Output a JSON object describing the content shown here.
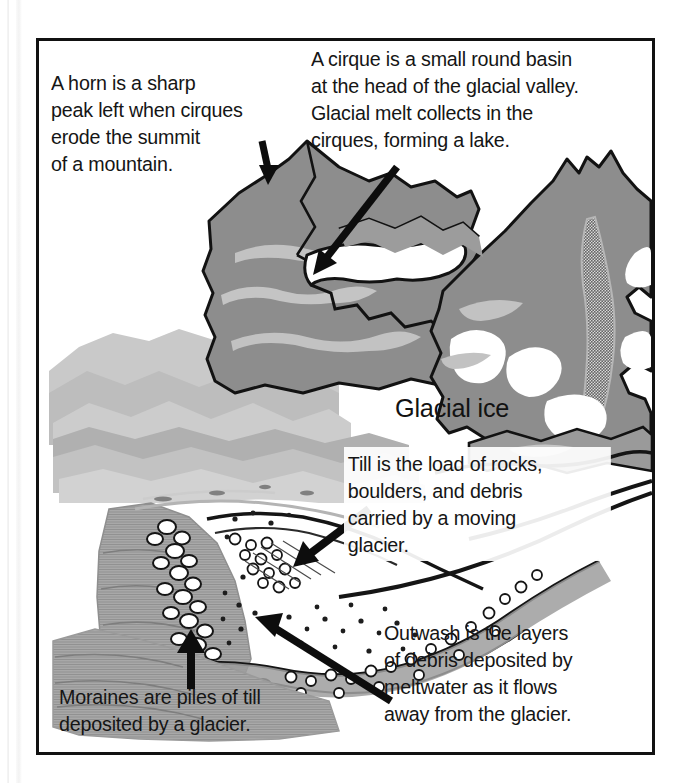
{
  "figure": {
    "kind": "glacial-landform-diagram",
    "frame_border_color": "#111111",
    "background_color": "#ffffff"
  },
  "labels": {
    "glacial_ice": "Glacial ice"
  },
  "captions": {
    "horn": "A horn is a sharp\npeak left when cirques\nerode the summit\nof a mountain.",
    "cirque": "A cirque is a small round basin\nat the head of the glacial valley.\nGlacial melt collects in the\ncirques, forming a lake.",
    "till": "Till is the load of rocks,\nboulders, and debris\ncarried by a moving\nglacier.",
    "outwash": "Outwash is the layers\nof debris deposited by\nmeltwater as it flows\naway from the glacier.",
    "moraine": "Moraines are piles of till\ndeposited by a glacier."
  },
  "arrows": [
    {
      "name": "horn-arrow",
      "from": "caption-horn",
      "to": "mountain-peak",
      "direction": "down"
    },
    {
      "name": "cirque-arrow",
      "from": "caption-cirque",
      "to": "cirque-basin",
      "direction": "down-left"
    },
    {
      "name": "till-arrow",
      "from": "caption-till",
      "to": "till-deposit",
      "direction": "down-left"
    },
    {
      "name": "outwash-arrow",
      "from": "caption-outwash",
      "to": "outwash-plain",
      "direction": "up-left"
    },
    {
      "name": "moraine-arrow",
      "from": "caption-moraine",
      "to": "lateral-moraine",
      "direction": "up"
    }
  ],
  "palette": {
    "ink": "#151515",
    "rock_dark": "#8a8a8a",
    "rock_mid": "#9e9e9e",
    "rock_light": "#b9b9b9",
    "rock_pale": "#cfcfcf",
    "ice_white": "#ffffff",
    "moraine_gray": "#a2a2a2",
    "stipple": "#6f6f6f"
  }
}
